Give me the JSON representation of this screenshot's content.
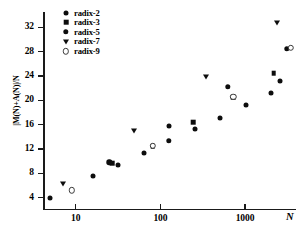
{
  "chart_data": {
    "type": "scatter",
    "title": "",
    "xlabel": "N",
    "ylabel": "|M(N)+A(N)|/N",
    "xscale": "log",
    "yscale": "linear",
    "xlim": [
      4.2,
      4000
    ],
    "ylim": [
      2.2,
      34.5
    ],
    "grid": false,
    "legend_position": "top-left",
    "xticks": [
      {
        "value": 10,
        "label": "10"
      },
      {
        "value": 100,
        "label": "100"
      },
      {
        "value": 1000,
        "label": "1000"
      }
    ],
    "yticks": [
      {
        "value": 4,
        "label": "4"
      },
      {
        "value": 8,
        "label": "8"
      },
      {
        "value": 12,
        "label": "12"
      },
      {
        "value": 16,
        "label": "16"
      },
      {
        "value": 20,
        "label": "20"
      },
      {
        "value": 24,
        "label": "24"
      },
      {
        "value": 28,
        "label": "28"
      },
      {
        "value": 32,
        "label": "32"
      }
    ],
    "series": [
      {
        "name": "radix-2",
        "marker": "filled-circle",
        "color": "#0d0d0d",
        "points": [
          {
            "x": 5,
            "y": 4.0
          },
          {
            "x": 16,
            "y": 7.6
          },
          {
            "x": 32,
            "y": 9.4
          },
          {
            "x": 64,
            "y": 11.4
          },
          {
            "x": 128,
            "y": 15.8
          },
          {
            "x": 256,
            "y": 15.3
          },
          {
            "x": 512,
            "y": 17.1
          },
          {
            "x": 1024,
            "y": 19.3
          },
          {
            "x": 2048,
            "y": 21.2
          },
          {
            "x": 2600,
            "y": 23.2
          }
        ]
      },
      {
        "name": "radix-3",
        "marker": "filled-square",
        "color": "#0d0d0d",
        "points": [
          {
            "x": 27,
            "y": 9.7
          },
          {
            "x": 81,
            "y": 12.5
          },
          {
            "x": 243,
            "y": 16.4
          },
          {
            "x": 729,
            "y": 20.5
          },
          {
            "x": 2187,
            "y": 24.4
          }
        ]
      },
      {
        "name": "radix-5",
        "marker": "filled-hex",
        "color": "#0d0d0d",
        "points": [
          {
            "x": 25,
            "y": 9.8
          },
          {
            "x": 125,
            "y": 13.3
          },
          {
            "x": 625,
            "y": 22.2
          },
          {
            "x": 3125,
            "y": 28.5
          }
        ]
      },
      {
        "name": "radix-7",
        "marker": "filled-triangle-down",
        "color": "#0d0d0d",
        "points": [
          {
            "x": 7,
            "y": 6.3
          },
          {
            "x": 49,
            "y": 15.0
          },
          {
            "x": 343,
            "y": 23.8
          },
          {
            "x": 2401,
            "y": 32.7
          }
        ]
      },
      {
        "name": "radix-9",
        "marker": "open-circle",
        "color": "#5a5a5a",
        "points": [
          {
            "x": 9,
            "y": 5.2
          },
          {
            "x": 81,
            "y": 12.5
          },
          {
            "x": 729,
            "y": 20.6
          },
          {
            "x": 3500,
            "y": 28.6
          }
        ]
      }
    ]
  }
}
